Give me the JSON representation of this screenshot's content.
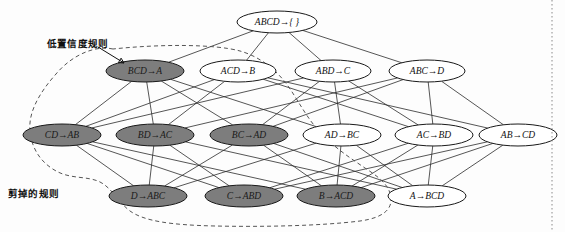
{
  "figure": {
    "type": "rule-lattice-diagram",
    "width": 565,
    "height": 232,
    "background_color": "#fdfdfd",
    "shaded_node_color": "#7d7d7d",
    "plain_node_color": "#ffffff",
    "edge_color": "#2b2b2b",
    "boundary_color": "#555555"
  },
  "annotations": {
    "low_confidence": {
      "text": "低置信度规则",
      "x": 47,
      "y": 36
    },
    "pruned_rules": {
      "text": "剪掉的规则",
      "x": 8,
      "y": 186
    }
  },
  "levels": [
    {
      "index": 0,
      "y": 22
    },
    {
      "index": 1,
      "y": 71
    },
    {
      "index": 2,
      "y": 135
    },
    {
      "index": 3,
      "y": 196
    }
  ],
  "nodes": [
    {
      "id": "n0",
      "label": "ABCD→{ }",
      "x": 277,
      "y": 22,
      "rx": 40,
      "ry": 11,
      "level": 0,
      "shaded": false
    },
    {
      "id": "n1",
      "label": "BCD→A",
      "x": 145,
      "y": 71,
      "rx": 39,
      "ry": 11,
      "level": 1,
      "shaded": true
    },
    {
      "id": "n2",
      "label": "ACD→B",
      "x": 238,
      "y": 71,
      "rx": 38,
      "ry": 11,
      "level": 1,
      "shaded": false
    },
    {
      "id": "n3",
      "label": "ABD→C",
      "x": 333,
      "y": 71,
      "rx": 38,
      "ry": 11,
      "level": 1,
      "shaded": false
    },
    {
      "id": "n4",
      "label": "ABC→D",
      "x": 427,
      "y": 71,
      "rx": 38,
      "ry": 11,
      "level": 1,
      "shaded": false
    },
    {
      "id": "n5",
      "label": "CD→AB",
      "x": 62,
      "y": 135,
      "rx": 39,
      "ry": 11,
      "level": 2,
      "shaded": true
    },
    {
      "id": "n6",
      "label": "BD→AC",
      "x": 155,
      "y": 135,
      "rx": 39,
      "ry": 11,
      "level": 2,
      "shaded": true
    },
    {
      "id": "n7",
      "label": "BC→AD",
      "x": 249,
      "y": 135,
      "rx": 39,
      "ry": 11,
      "level": 2,
      "shaded": true
    },
    {
      "id": "n8",
      "label": "AD→BC",
      "x": 342,
      "y": 135,
      "rx": 39,
      "ry": 11,
      "level": 2,
      "shaded": false
    },
    {
      "id": "n9",
      "label": "AC→BD",
      "x": 434,
      "y": 135,
      "rx": 39,
      "ry": 11,
      "level": 2,
      "shaded": false
    },
    {
      "id": "n10",
      "label": "AB→CD",
      "x": 518,
      "y": 135,
      "rx": 39,
      "ry": 11,
      "level": 2,
      "shaded": false
    },
    {
      "id": "n11",
      "label": "D→ABC",
      "x": 148,
      "y": 196,
      "rx": 39,
      "ry": 11,
      "level": 3,
      "shaded": true
    },
    {
      "id": "n12",
      "label": "C→ABD",
      "x": 244,
      "y": 196,
      "rx": 39,
      "ry": 11,
      "level": 3,
      "shaded": true
    },
    {
      "id": "n13",
      "label": "B→ACD",
      "x": 336,
      "y": 196,
      "rx": 39,
      "ry": 11,
      "level": 3,
      "shaded": true
    },
    {
      "id": "n14",
      "label": "A→BCD",
      "x": 427,
      "y": 196,
      "rx": 39,
      "ry": 11,
      "level": 3,
      "shaded": false
    }
  ],
  "edges": [
    [
      "n0",
      "n1"
    ],
    [
      "n0",
      "n2"
    ],
    [
      "n0",
      "n3"
    ],
    [
      "n0",
      "n4"
    ],
    [
      "n1",
      "n5"
    ],
    [
      "n1",
      "n6"
    ],
    [
      "n1",
      "n7"
    ],
    [
      "n1",
      "n8"
    ],
    [
      "n2",
      "n5"
    ],
    [
      "n2",
      "n6"
    ],
    [
      "n2",
      "n9"
    ],
    [
      "n2",
      "n10"
    ],
    [
      "n3",
      "n5"
    ],
    [
      "n3",
      "n7"
    ],
    [
      "n3",
      "n8"
    ],
    [
      "n3",
      "n9"
    ],
    [
      "n4",
      "n6"
    ],
    [
      "n4",
      "n7"
    ],
    [
      "n4",
      "n9"
    ],
    [
      "n4",
      "n10"
    ],
    [
      "n5",
      "n11"
    ],
    [
      "n5",
      "n12"
    ],
    [
      "n5",
      "n13"
    ],
    [
      "n6",
      "n11"
    ],
    [
      "n6",
      "n12"
    ],
    [
      "n6",
      "n14"
    ],
    [
      "n7",
      "n11"
    ],
    [
      "n7",
      "n13"
    ],
    [
      "n7",
      "n14"
    ],
    [
      "n8",
      "n11"
    ],
    [
      "n8",
      "n13"
    ],
    [
      "n8",
      "n14"
    ],
    [
      "n9",
      "n12"
    ],
    [
      "n9",
      "n13"
    ],
    [
      "n9",
      "n14"
    ],
    [
      "n10",
      "n12"
    ],
    [
      "n10",
      "n13"
    ],
    [
      "n10",
      "n14"
    ]
  ],
  "boundary_path": "M 113 49 C 95 45, 72 55, 56 74 C 40 92, 28 112, 30 131 C 32 152, 44 165, 58 172 C 72 179, 88 176, 100 182 C 112 188, 118 202, 130 211 C 144 221, 170 225, 215 226 C 262 227, 320 226, 360 221 C 382 218, 392 210, 391 198 C 390 186, 380 178, 368 170 C 350 158, 332 146, 318 130 C 304 114, 296 96, 285 82 C 274 68, 258 56, 240 51 C 215 44, 160 44, 113 49 Z",
  "leader_line": {
    "x1": 98,
    "y1": 47,
    "x2": 124,
    "y2": 63
  },
  "right_rule_x": 552
}
